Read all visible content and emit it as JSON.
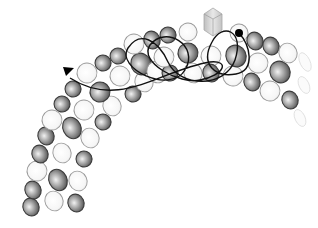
{
  "figure": {
    "colors": {
      "background": "#ffffff",
      "dark_subunit_fill": "#8a8a8a",
      "dark_subunit_stroke": "#3a3a3a",
      "light_subunit_fill": "#f4f4f4",
      "light_subunit_stroke": "#9a9a9a",
      "trajectory": "#111111",
      "cargo": "#c8c8c8"
    },
    "subunits": [
      {
        "x": 31,
        "y": 207,
        "rx": 8,
        "ry": 9,
        "type": "dark"
      },
      {
        "x": 33,
        "y": 190,
        "rx": 8,
        "ry": 9,
        "type": "dark"
      },
      {
        "x": 54,
        "y": 201,
        "rx": 9,
        "ry": 10,
        "type": "light"
      },
      {
        "x": 76,
        "y": 203,
        "rx": 8,
        "ry": 9,
        "type": "dark"
      },
      {
        "x": 37,
        "y": 171,
        "rx": 10,
        "ry": 10,
        "type": "light"
      },
      {
        "x": 58,
        "y": 180,
        "rx": 9,
        "ry": 11,
        "type": "dark"
      },
      {
        "x": 78,
        "y": 181,
        "rx": 9,
        "ry": 10,
        "type": "light"
      },
      {
        "x": 40,
        "y": 154,
        "rx": 8,
        "ry": 9,
        "type": "dark"
      },
      {
        "x": 62,
        "y": 153,
        "rx": 9,
        "ry": 10,
        "type": "light"
      },
      {
        "x": 84,
        "y": 159,
        "rx": 8,
        "ry": 8,
        "type": "dark"
      },
      {
        "x": 46,
        "y": 136,
        "rx": 8,
        "ry": 9,
        "type": "dark"
      },
      {
        "x": 72,
        "y": 128,
        "rx": 9,
        "ry": 11,
        "type": "dark"
      },
      {
        "x": 90,
        "y": 138,
        "rx": 9,
        "ry": 10,
        "type": "light"
      },
      {
        "x": 52,
        "y": 120,
        "rx": 10,
        "ry": 10,
        "type": "light"
      },
      {
        "x": 103,
        "y": 122,
        "rx": 8,
        "ry": 8,
        "type": "dark"
      },
      {
        "x": 62,
        "y": 104,
        "rx": 8,
        "ry": 8,
        "type": "dark"
      },
      {
        "x": 84,
        "y": 110,
        "rx": 10,
        "ry": 10,
        "type": "light"
      },
      {
        "x": 112,
        "y": 106,
        "rx": 9,
        "ry": 10,
        "type": "light"
      },
      {
        "x": 73,
        "y": 89,
        "rx": 8,
        "ry": 8,
        "type": "dark"
      },
      {
        "x": 100,
        "y": 92,
        "rx": 10,
        "ry": 10,
        "type": "dark"
      },
      {
        "x": 133,
        "y": 94,
        "rx": 8,
        "ry": 8,
        "type": "dark"
      },
      {
        "x": 87,
        "y": 73,
        "rx": 10,
        "ry": 10,
        "type": "light"
      },
      {
        "x": 120,
        "y": 76,
        "rx": 10,
        "ry": 10,
        "type": "light"
      },
      {
        "x": 144,
        "y": 82,
        "rx": 9,
        "ry": 10,
        "type": "light"
      },
      {
        "x": 103,
        "y": 63,
        "rx": 8,
        "ry": 8,
        "type": "dark"
      },
      {
        "x": 118,
        "y": 56,
        "rx": 8,
        "ry": 8,
        "type": "dark"
      },
      {
        "x": 141,
        "y": 64,
        "rx": 10,
        "ry": 11,
        "type": "dark"
      },
      {
        "x": 134,
        "y": 44,
        "rx": 10,
        "ry": 10,
        "type": "light"
      },
      {
        "x": 152,
        "y": 40,
        "rx": 8,
        "ry": 9,
        "type": "dark"
      },
      {
        "x": 157,
        "y": 72,
        "rx": 10,
        "ry": 11,
        "type": "light"
      },
      {
        "x": 170,
        "y": 73,
        "rx": 8,
        "ry": 8,
        "type": "dark"
      },
      {
        "x": 164,
        "y": 57,
        "rx": 10,
        "ry": 10,
        "type": "light"
      },
      {
        "x": 168,
        "y": 35,
        "rx": 8,
        "ry": 8,
        "type": "dark"
      },
      {
        "x": 188,
        "y": 32,
        "rx": 9,
        "ry": 9,
        "type": "light"
      },
      {
        "x": 188,
        "y": 53,
        "rx": 10,
        "ry": 10,
        "type": "dark"
      },
      {
        "x": 193,
        "y": 73,
        "rx": 9,
        "ry": 10,
        "type": "light"
      },
      {
        "x": 211,
        "y": 56,
        "rx": 10,
        "ry": 10,
        "type": "light"
      },
      {
        "x": 211,
        "y": 73,
        "rx": 8,
        "ry": 9,
        "type": "dark"
      },
      {
        "x": 233,
        "y": 76,
        "rx": 10,
        "ry": 10,
        "type": "light"
      },
      {
        "x": 236,
        "y": 56,
        "rx": 10,
        "ry": 11,
        "type": "dark"
      },
      {
        "x": 239,
        "y": 33,
        "rx": 9,
        "ry": 9,
        "type": "light"
      },
      {
        "x": 255,
        "y": 41,
        "rx": 8,
        "ry": 9,
        "type": "dark"
      },
      {
        "x": 271,
        "y": 46,
        "rx": 8,
        "ry": 9,
        "type": "dark"
      },
      {
        "x": 258,
        "y": 63,
        "rx": 10,
        "ry": 10,
        "type": "light"
      },
      {
        "x": 252,
        "y": 82,
        "rx": 8,
        "ry": 9,
        "type": "dark"
      },
      {
        "x": 280,
        "y": 72,
        "rx": 10,
        "ry": 11,
        "type": "dark"
      },
      {
        "x": 288,
        "y": 53,
        "rx": 9,
        "ry": 10,
        "type": "light"
      },
      {
        "x": 270,
        "y": 91,
        "rx": 10,
        "ry": 10,
        "type": "light"
      },
      {
        "x": 290,
        "y": 100,
        "rx": 8,
        "ry": 9,
        "type": "dark"
      },
      {
        "x": 305,
        "y": 62,
        "rx": 5,
        "ry": 10,
        "type": "faint"
      },
      {
        "x": 304,
        "y": 85,
        "rx": 5,
        "ry": 9,
        "type": "faint"
      },
      {
        "x": 300,
        "y": 118,
        "rx": 5,
        "ry": 9,
        "type": "faint"
      }
    ],
    "cargo": {
      "x": 213,
      "y": 28,
      "label": ""
    },
    "trajectory": {
      "start_marker": "filled-dot",
      "start": {
        "x": 239,
        "y": 33
      },
      "end_marker": "arrowhead",
      "end": {
        "x": 63,
        "y": 67
      },
      "path": "M239,33 C250,45 256,70 236,74 C215,78 200,64 212,42 C222,22 245,30 235,60 C225,88 180,88 168,62 C158,40 140,30 128,48 C115,68 170,95 185,70 C200,45 165,25 150,45 C138,62 180,85 200,80 C225,75 230,60 210,62 C160,70 120,110 70,78"
    }
  }
}
